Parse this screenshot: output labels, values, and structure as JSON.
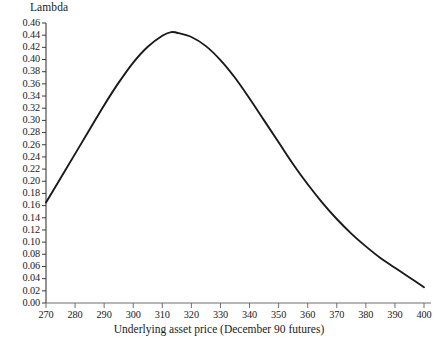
{
  "chart_data": {
    "type": "line",
    "title": "",
    "ylabel": "Lambda",
    "xlabel": "Underlying asset price (December 90 futures)",
    "xlim": [
      270,
      400
    ],
    "ylim": [
      0.0,
      0.46
    ],
    "grid": false,
    "legend": null,
    "xticks": [
      270,
      280,
      290,
      300,
      310,
      320,
      330,
      340,
      350,
      360,
      370,
      380,
      390,
      400
    ],
    "xticklabels": [
      "270",
      "280",
      "290",
      "300",
      "310",
      "320",
      "330",
      "340",
      "350",
      "360",
      "370",
      "380",
      "390",
      "400"
    ],
    "yticks": [
      0.0,
      0.02,
      0.04,
      0.06,
      0.08,
      0.1,
      0.12,
      0.14,
      0.16,
      0.18,
      0.2,
      0.22,
      0.24,
      0.26,
      0.28,
      0.3,
      0.32,
      0.34,
      0.36,
      0.38,
      0.4,
      0.42,
      0.44,
      0.46
    ],
    "yticklabels": [
      "0.00",
      "0.02",
      "0.04",
      "0.06",
      "0.08",
      "0.10",
      "0.12",
      "0.14",
      "0.16",
      "0.18",
      "0.20",
      "0.22",
      "0.24",
      "0.26",
      "0.28",
      "0.30",
      "0.32",
      "0.34",
      "0.36",
      "0.38",
      "0.40",
      "0.42",
      "0.44",
      "0.46"
    ],
    "series": [
      {
        "name": "Lambda",
        "color": "#1a1a1a",
        "x": [
          270,
          275,
          280,
          285,
          290,
          295,
          300,
          305,
          310,
          313,
          315,
          320,
          325,
          330,
          335,
          340,
          345,
          350,
          355,
          360,
          365,
          370,
          375,
          380,
          385,
          390,
          395,
          400
        ],
        "y": [
          0.165,
          0.205,
          0.245,
          0.285,
          0.325,
          0.362,
          0.395,
          0.421,
          0.439,
          0.445,
          0.444,
          0.437,
          0.422,
          0.399,
          0.37,
          0.336,
          0.3,
          0.264,
          0.228,
          0.195,
          0.165,
          0.138,
          0.114,
          0.093,
          0.074,
          0.058,
          0.042,
          0.026
        ]
      }
    ]
  }
}
